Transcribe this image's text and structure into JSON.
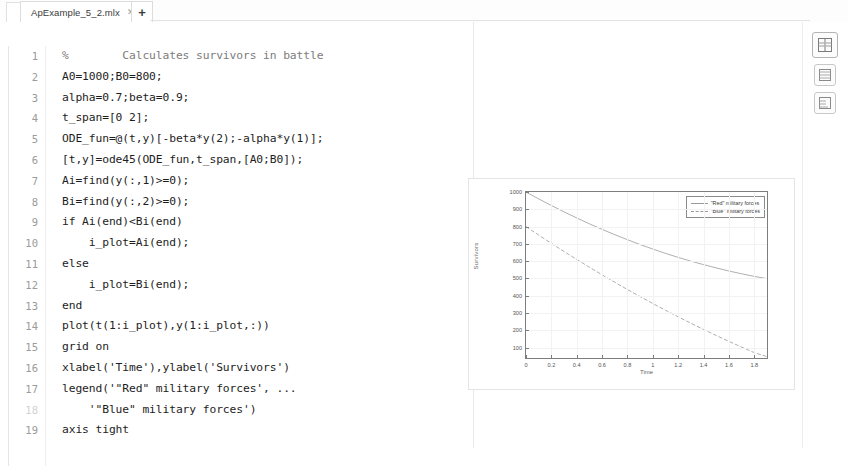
{
  "window": {
    "tab": {
      "title": "ApExample_5_2.mlx",
      "close_icon": "close-icon",
      "new_tab_label": "+"
    }
  },
  "editor": {
    "lines": [
      {
        "n": "1",
        "text": "%        Calculates survivors in battle",
        "style": "comment"
      },
      {
        "n": "2",
        "text": "A0=1000;B0=800;",
        "style": "code"
      },
      {
        "n": "3",
        "text": "alpha=0.7;beta=0.9;",
        "style": "code"
      },
      {
        "n": "4",
        "text": "t_span=[0 2];",
        "style": "code"
      },
      {
        "n": "5",
        "text": "ODE_fun=@(t,y)[-beta*y(2);-alpha*y(1)];",
        "style": "code"
      },
      {
        "n": "6",
        "text": "[t,y]=ode45(ODE_fun,t_span,[A0;B0]);",
        "style": "code"
      },
      {
        "n": "7",
        "text": "Ai=find(y(:,1)>=0);",
        "style": "code"
      },
      {
        "n": "8",
        "text": "Bi=find(y(:,2)>=0);",
        "style": "code"
      },
      {
        "n": "9",
        "text": "if Ai(end)<Bi(end)",
        "style": "code"
      },
      {
        "n": "10",
        "text": "    i_plot=Ai(end);",
        "style": "code"
      },
      {
        "n": "11",
        "text": "else",
        "style": "code"
      },
      {
        "n": "12",
        "text": "    i_plot=Bi(end);",
        "style": "code"
      },
      {
        "n": "13",
        "text": "end",
        "style": "code"
      },
      {
        "n": "14",
        "text": "plot(t(1:i_plot),y(1:i_plot,:))",
        "style": "code"
      },
      {
        "n": "15",
        "text": "grid on",
        "style": "code"
      },
      {
        "n": "16",
        "text": "xlabel('Time'),ylabel('Survivors')",
        "style": "code"
      },
      {
        "n": "17",
        "text": "legend('\"Red\" military forces', ...",
        "style": "code"
      },
      {
        "n": "18",
        "text": "    '\"Blue\" military forces')",
        "style": "code",
        "faint_num": true
      },
      {
        "n": "19",
        "text": "axis tight",
        "style": "code"
      }
    ]
  },
  "chart_data": {
    "type": "line",
    "title": "",
    "xlabel": "Time",
    "ylabel": "Survivors",
    "xlim": [
      0,
      1.9
    ],
    "ylim": [
      40,
      1000
    ],
    "grid": true,
    "legend_position": "top-right",
    "xticks": [
      "0",
      "0.2",
      "0.4",
      "0.6",
      "0.8",
      "1",
      "1.2",
      "1.4",
      "1.6",
      "1.8"
    ],
    "xtick_values": [
      0,
      0.2,
      0.4,
      0.6,
      0.8,
      1,
      1.2,
      1.4,
      1.6,
      1.8
    ],
    "yticks": [
      "100",
      "200",
      "300",
      "400",
      "500",
      "600",
      "700",
      "800",
      "900",
      "1000"
    ],
    "ytick_values": [
      100,
      200,
      300,
      400,
      500,
      600,
      700,
      800,
      900,
      1000
    ],
    "series": [
      {
        "name": "\"Red\" military forces",
        "color": "#9a9a9a",
        "x": [
          0,
          0.1,
          0.2,
          0.3,
          0.4,
          0.5,
          0.6,
          0.7,
          0.8,
          0.9,
          1.0,
          1.1,
          1.2,
          1.3,
          1.4,
          1.5,
          1.6,
          1.7,
          1.8,
          1.9
        ],
        "values": [
          1000,
          960,
          922,
          885,
          850,
          816,
          784,
          753,
          724,
          696,
          670,
          645,
          622,
          600,
          580,
          561,
          543,
          527,
          512,
          499
        ]
      },
      {
        "name": "\"Blue\" military forces",
        "color": "#9a9a9a",
        "x": [
          0,
          0.1,
          0.2,
          0.3,
          0.4,
          0.5,
          0.6,
          0.7,
          0.8,
          0.9,
          1.0,
          1.1,
          1.2,
          1.3,
          1.4,
          1.5,
          1.6,
          1.7,
          1.8,
          1.9
        ],
        "values": [
          800,
          751,
          703,
          656,
          610,
          565,
          521,
          478,
          436,
          395,
          355,
          316,
          278,
          241,
          205,
          170,
          136,
          103,
          71,
          48
        ]
      }
    ]
  },
  "rail": {
    "buttons": [
      {
        "name": "output-inline-icon",
        "label": ""
      },
      {
        "name": "output-right-icon",
        "label": ""
      },
      {
        "name": "output-bottom-icon",
        "label": ""
      }
    ]
  }
}
